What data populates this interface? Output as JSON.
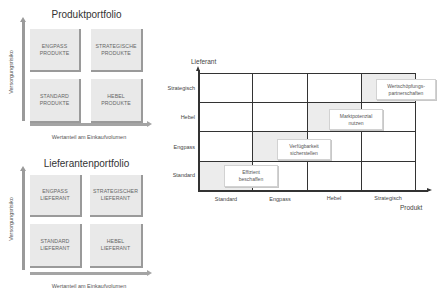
{
  "produktportfolio": {
    "title": "Produktportfolio",
    "y_axis_label": "Versorgungsrisiko",
    "x_axis_label": "Wertanteil am Einkaufvolumen",
    "quadrants": {
      "top_left": "ENGPASS\nPRODUKTE",
      "top_right": "STRATEGISCHE\nPRODUKTE",
      "bottom_left": "STANDARD\nPRODUKTE",
      "bottom_right": "HEBEL\nPRODUKTE"
    }
  },
  "lieferantenportfolio": {
    "title": "Lieferantenportfolio",
    "y_axis_label": "Versorgungsrisiko",
    "x_axis_label": "Wertanteil am Einkaufvolumen",
    "quadrants": {
      "top_left": "ENGPASS\nLIEFERANT",
      "top_right": "STRATEGISCHER\nLIEFERANT",
      "bottom_left": "STANDARD\nLIEFERANT",
      "bottom_right": "HEBEL\nLIEFERANT"
    }
  },
  "matrix": {
    "y_axis_title": "Lieferant",
    "x_axis_title": "Produkt",
    "y_categories": [
      "Strategisch",
      "Hebel",
      "Engpass",
      "Standard"
    ],
    "x_categories": [
      "Standard",
      "Engpass",
      "Hebel",
      "Strategisch"
    ],
    "strategies": [
      {
        "label": "Effizient\nbeschaffen",
        "x": "Standard",
        "y": "Standard"
      },
      {
        "label": "Verfügbarkeit\nsicherstellen",
        "x": "Engpass",
        "y": "Engpass"
      },
      {
        "label": "Marktpotenzial\nnutzen",
        "x": "Hebel",
        "y": "Hebel"
      },
      {
        "label": "Wertschöpfungs-\npartnerschaften",
        "x": "Strategisch",
        "y": "Strategisch"
      }
    ],
    "colors": {
      "shaded_cell": "#ececec",
      "grid_line": "#333333",
      "portfolio_box": "#e9e9e9"
    }
  }
}
